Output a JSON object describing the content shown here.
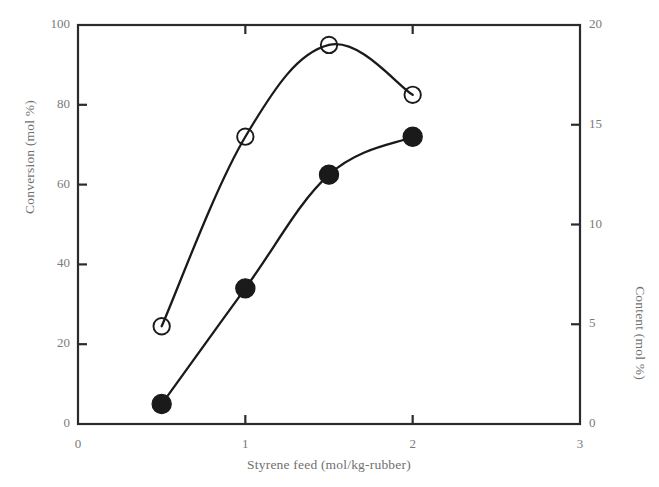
{
  "chart_data": {
    "type": "scatter",
    "title": "",
    "xlabel": "Styrene feed (mol/kg-rubber)",
    "ylabel": "Conversion (mol %)",
    "ylabel_right": "Content (mol %)",
    "xlim": [
      0,
      3
    ],
    "ylim": [
      0,
      100
    ],
    "ylim_right": [
      0,
      20
    ],
    "xticks": [
      "0",
      "1",
      "2",
      "3"
    ],
    "xtick_values": [
      0,
      1,
      2,
      3
    ],
    "yticks": [
      "0",
      "20",
      "40",
      "60",
      "80",
      "100"
    ],
    "ytick_values": [
      0,
      20,
      40,
      60,
      80,
      100
    ],
    "yticks_right": [
      "0",
      "5",
      "10",
      "15",
      "20"
    ],
    "ytick_right_values": [
      0,
      5,
      10,
      15,
      20
    ],
    "grid": false,
    "legend": "none",
    "series": [
      {
        "name": "Conversion",
        "marker": "open-circle",
        "axis": "left",
        "x": [
          0.5,
          1.0,
          1.5,
          2.0
        ],
        "values": [
          24.5,
          72.0,
          95.0,
          82.5
        ],
        "line": "smooth-curve",
        "color": "#1a1a1a"
      },
      {
        "name": "Content",
        "marker": "filled-circle",
        "axis": "right",
        "x": [
          0.5,
          1.0,
          1.5,
          2.0
        ],
        "values": [
          1.0,
          6.8,
          12.5,
          14.4
        ],
        "line": "smooth-curve",
        "color": "#1a1a1a"
      }
    ]
  },
  "axes": {
    "frame_color": "#2b2b2b",
    "tick_color": "#2b2b2b"
  }
}
